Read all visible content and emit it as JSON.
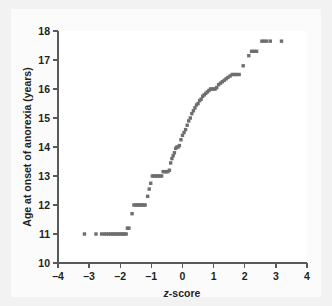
{
  "figure": {
    "background_color": "#f2f2f2",
    "panel_color": "#ffffff",
    "point_color": "#6d6e71",
    "axis_color": "#58595b",
    "text_color": "#231f20"
  },
  "chart_data": {
    "type": "scatter",
    "title": "",
    "xlabel": "z-score",
    "xlabel_italic_prefix": "z",
    "xlabel_rest": "-score",
    "ylabel": "Age at onset of anorexia (years)",
    "xlim": [
      -4,
      4
    ],
    "ylim": [
      10,
      18
    ],
    "xticks": [
      -4,
      -3,
      -2,
      -1,
      0,
      1,
      2,
      3,
      4
    ],
    "xticklabels": [
      "–4",
      "–3",
      "–2",
      "–1",
      "0",
      "1",
      "2",
      "3",
      "4"
    ],
    "yticks": [
      10,
      11,
      12,
      13,
      14,
      15,
      16,
      17,
      18
    ],
    "yticklabels": [
      "10",
      "11",
      "12",
      "13",
      "14",
      "15",
      "16",
      "17",
      "18"
    ],
    "grid": false,
    "legend": null,
    "marker": "square",
    "marker_size_px": 3.4,
    "points": [
      {
        "x": -3.15,
        "y": 11.0
      },
      {
        "x": -2.78,
        "y": 11.0
      },
      {
        "x": -2.6,
        "y": 11.0
      },
      {
        "x": -2.52,
        "y": 11.0
      },
      {
        "x": -2.45,
        "y": 11.0
      },
      {
        "x": -2.38,
        "y": 11.0
      },
      {
        "x": -2.31,
        "y": 11.0
      },
      {
        "x": -2.25,
        "y": 11.0
      },
      {
        "x": -2.19,
        "y": 11.0
      },
      {
        "x": -2.13,
        "y": 11.0
      },
      {
        "x": -2.07,
        "y": 11.0
      },
      {
        "x": -2.01,
        "y": 11.0
      },
      {
        "x": -1.96,
        "y": 11.0
      },
      {
        "x": -1.91,
        "y": 11.0
      },
      {
        "x": -1.86,
        "y": 11.0
      },
      {
        "x": -1.81,
        "y": 11.0
      },
      {
        "x": -1.77,
        "y": 11.2
      },
      {
        "x": -1.72,
        "y": 11.2
      },
      {
        "x": -1.62,
        "y": 11.7
      },
      {
        "x": -1.56,
        "y": 12.0
      },
      {
        "x": -1.5,
        "y": 12.0
      },
      {
        "x": -1.45,
        "y": 12.0
      },
      {
        "x": -1.4,
        "y": 12.0
      },
      {
        "x": -1.35,
        "y": 12.0
      },
      {
        "x": -1.3,
        "y": 12.0
      },
      {
        "x": -1.25,
        "y": 12.0
      },
      {
        "x": -1.2,
        "y": 12.0
      },
      {
        "x": -1.12,
        "y": 12.3
      },
      {
        "x": -1.07,
        "y": 12.55
      },
      {
        "x": -1.02,
        "y": 12.75
      },
      {
        "x": -0.97,
        "y": 13.0
      },
      {
        "x": -0.92,
        "y": 13.0
      },
      {
        "x": -0.87,
        "y": 13.0
      },
      {
        "x": -0.82,
        "y": 13.0
      },
      {
        "x": -0.77,
        "y": 13.0
      },
      {
        "x": -0.72,
        "y": 13.0
      },
      {
        "x": -0.67,
        "y": 13.0
      },
      {
        "x": -0.62,
        "y": 13.15
      },
      {
        "x": -0.57,
        "y": 13.15
      },
      {
        "x": -0.52,
        "y": 13.15
      },
      {
        "x": -0.47,
        "y": 13.15
      },
      {
        "x": -0.42,
        "y": 13.2
      },
      {
        "x": -0.38,
        "y": 13.45
      },
      {
        "x": -0.34,
        "y": 13.6
      },
      {
        "x": -0.3,
        "y": 13.7
      },
      {
        "x": -0.26,
        "y": 13.8
      },
      {
        "x": -0.22,
        "y": 13.95
      },
      {
        "x": -0.18,
        "y": 14.0
      },
      {
        "x": -0.14,
        "y": 14.0
      },
      {
        "x": -0.1,
        "y": 14.05
      },
      {
        "x": -0.05,
        "y": 14.25
      },
      {
        "x": 0.0,
        "y": 14.4
      },
      {
        "x": 0.05,
        "y": 14.5
      },
      {
        "x": 0.1,
        "y": 14.6
      },
      {
        "x": 0.15,
        "y": 14.75
      },
      {
        "x": 0.2,
        "y": 14.9
      },
      {
        "x": 0.25,
        "y": 15.0
      },
      {
        "x": 0.3,
        "y": 15.15
      },
      {
        "x": 0.35,
        "y": 15.25
      },
      {
        "x": 0.4,
        "y": 15.35
      },
      {
        "x": 0.45,
        "y": 15.45
      },
      {
        "x": 0.5,
        "y": 15.5
      },
      {
        "x": 0.55,
        "y": 15.6
      },
      {
        "x": 0.6,
        "y": 15.65
      },
      {
        "x": 0.65,
        "y": 15.75
      },
      {
        "x": 0.7,
        "y": 15.8
      },
      {
        "x": 0.75,
        "y": 15.85
      },
      {
        "x": 0.8,
        "y": 15.9
      },
      {
        "x": 0.85,
        "y": 15.95
      },
      {
        "x": 0.9,
        "y": 16.0
      },
      {
        "x": 0.95,
        "y": 16.0
      },
      {
        "x": 1.0,
        "y": 16.0
      },
      {
        "x": 1.05,
        "y": 16.0
      },
      {
        "x": 1.1,
        "y": 16.05
      },
      {
        "x": 1.16,
        "y": 16.15
      },
      {
        "x": 1.22,
        "y": 16.2
      },
      {
        "x": 1.28,
        "y": 16.25
      },
      {
        "x": 1.34,
        "y": 16.3
      },
      {
        "x": 1.4,
        "y": 16.35
      },
      {
        "x": 1.46,
        "y": 16.4
      },
      {
        "x": 1.53,
        "y": 16.45
      },
      {
        "x": 1.6,
        "y": 16.5
      },
      {
        "x": 1.67,
        "y": 16.5
      },
      {
        "x": 1.74,
        "y": 16.5
      },
      {
        "x": 1.82,
        "y": 16.5
      },
      {
        "x": 1.95,
        "y": 16.8
      },
      {
        "x": 2.13,
        "y": 17.15
      },
      {
        "x": 2.22,
        "y": 17.3
      },
      {
        "x": 2.3,
        "y": 17.3
      },
      {
        "x": 2.38,
        "y": 17.3
      },
      {
        "x": 2.55,
        "y": 17.65
      },
      {
        "x": 2.62,
        "y": 17.65
      },
      {
        "x": 2.7,
        "y": 17.65
      },
      {
        "x": 2.82,
        "y": 17.65
      },
      {
        "x": 3.18,
        "y": 17.65
      }
    ]
  }
}
